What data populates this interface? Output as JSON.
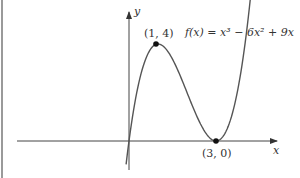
{
  "chart_data": {
    "type": "line",
    "title": "",
    "function_label": "f(x) = x³ − 6x² + 9x",
    "xlabel": "x",
    "ylabel": "y",
    "points": [
      {
        "label": "(1, 4)",
        "x": 1,
        "y": 4,
        "kind": "local maximum"
      },
      {
        "label": "(3, 0)",
        "x": 3,
        "y": 0,
        "kind": "local minimum"
      }
    ],
    "series": [
      {
        "name": "f(x) = x^3 - 6x^2 + 9x",
        "x_range": [
          -0.1,
          4.3
        ]
      }
    ],
    "xlim": [
      -3.8,
      5.3
    ],
    "ylim": [
      -1.2,
      5.2
    ],
    "grid": false,
    "legend": "none"
  },
  "labels": {
    "x_axis": "x",
    "y_axis": "y",
    "max_point": "(1, 4)",
    "min_point": "(3, 0)",
    "function": "f(x) = x³ − 6x² + 9x"
  }
}
